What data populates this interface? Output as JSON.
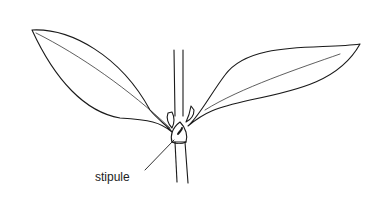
{
  "diagram": {
    "labels": [
      {
        "id": "stipule",
        "text": "stipule"
      }
    ],
    "colors": {
      "stroke": "#1a1a1a",
      "background": "#ffffff",
      "text": "#222222"
    }
  }
}
